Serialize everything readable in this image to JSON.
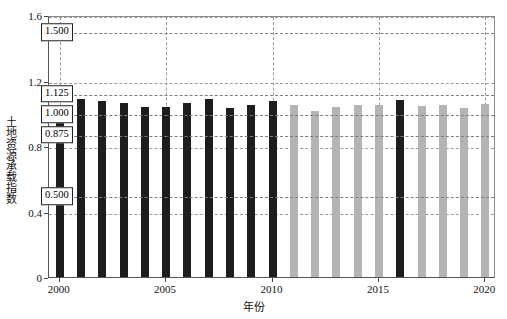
{
  "chart_data": {
    "type": "bar",
    "title": "",
    "xlabel": "年份",
    "ylabel": "土地资源承载指数",
    "ylim": [
      0,
      1.6
    ],
    "xlim": [
      1999.5,
      2020.5
    ],
    "grid": true,
    "legend": "none",
    "yticks": [
      "0",
      "0.4",
      "0.8",
      "1.2",
      "1.6"
    ],
    "ytick_values": [
      0,
      0.4,
      0.8,
      1.2,
      1.6
    ],
    "xticks": [
      "2000",
      "2005",
      "2010",
      "2015",
      "2020"
    ],
    "xtick_values": [
      2000,
      2005,
      2010,
      2015,
      2020
    ],
    "reference_lines": [
      {
        "label": "1.500",
        "value": 1.5
      },
      {
        "label": "1.125",
        "value": 1.125
      },
      {
        "label": "1.000",
        "value": 1.0
      },
      {
        "label": "0.875",
        "value": 0.875
      },
      {
        "label": "0.500",
        "value": 0.5
      }
    ],
    "categories": [
      "2000",
      "2001",
      "2002",
      "2003",
      "2004",
      "2005",
      "2006",
      "2007",
      "2008",
      "2009",
      "2010",
      "2011",
      "2012",
      "2013",
      "2014",
      "2015",
      "2016",
      "2017",
      "2018",
      "2019",
      "2020"
    ],
    "values": [
      1.03,
      1.09,
      1.075,
      1.06,
      1.04,
      1.04,
      1.065,
      1.085,
      1.035,
      1.05,
      1.075,
      1.048,
      1.012,
      1.04,
      1.05,
      1.052,
      1.08,
      1.043,
      1.05,
      1.03,
      1.055
    ],
    "bar_colors": [
      "dark",
      "dark",
      "dark",
      "dark",
      "dark",
      "dark",
      "dark",
      "dark",
      "dark",
      "dark",
      "dark",
      "light",
      "light",
      "light",
      "light",
      "light",
      "dark",
      "light",
      "light",
      "light",
      "light"
    ],
    "color_dark": "#1d1d1d",
    "color_light": "#b4b4b4",
    "grid_color": "#9a9a9a",
    "axis_color": "#555555"
  },
  "caption": {
    "top_partial": ""
  }
}
